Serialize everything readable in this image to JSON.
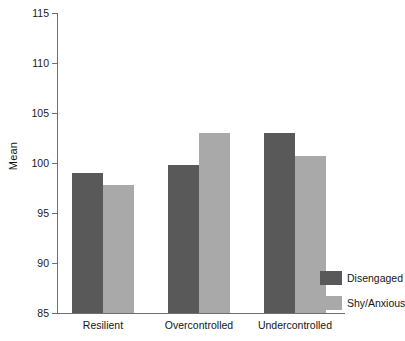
{
  "chart_data": {
    "type": "bar",
    "title": "",
    "subtitle": "",
    "xlabel": "",
    "ylabel": "Mean",
    "categories": [
      "Resilient",
      "Overcontrolled",
      "Undercontrolled"
    ],
    "series": [
      {
        "name": "Disengaged",
        "color": "#595959",
        "values": [
          99.0,
          99.8,
          103.0
        ]
      },
      {
        "name": "Shy/Anxious",
        "color": "#a9a9a9",
        "values": [
          97.8,
          103.0,
          100.7
        ]
      }
    ],
    "ylim": [
      85,
      115
    ],
    "yticks": [
      85,
      90,
      95,
      100,
      105,
      110,
      115
    ],
    "ytick_labels": [
      "85",
      "90",
      "95",
      "100",
      "105",
      "110",
      "115"
    ],
    "grid": false,
    "legend_position": "bottom-right-outside",
    "axis_color": "#6f6f6f",
    "background": "#ffffff"
  }
}
